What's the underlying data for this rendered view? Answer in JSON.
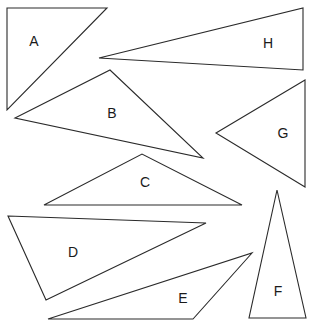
{
  "diagram": {
    "title": "",
    "stroke_color": "#2a2a2a",
    "triangles": [
      {
        "label": "A"
      },
      {
        "label": "H"
      },
      {
        "label": "B"
      },
      {
        "label": "G"
      },
      {
        "label": "C"
      },
      {
        "label": "D"
      },
      {
        "label": "E"
      },
      {
        "label": "F"
      }
    ]
  }
}
